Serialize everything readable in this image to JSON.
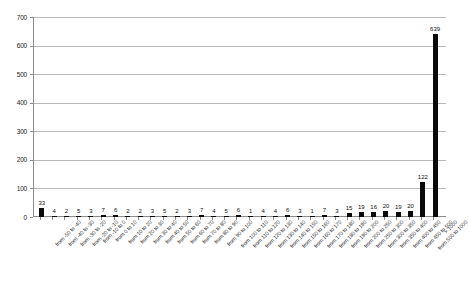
{
  "chart_data": {
    "type": "bar",
    "title": "",
    "subtitle": "",
    "xlabel": "",
    "ylabel": "",
    "ylim": [
      0,
      700
    ],
    "ytick_step": 100,
    "yticks": [
      0,
      100,
      200,
      300,
      400,
      500,
      600,
      700
    ],
    "ytick_labels": [
      "0",
      "100",
      "200",
      "300",
      "400",
      "500",
      "600",
      "700"
    ],
    "grid": true,
    "grid_axis": "y",
    "legend": false,
    "legend_position": "none",
    "bar_color": "#0a0a0a",
    "show_value_labels": true,
    "categories": [
      "from -50 to -40",
      "from -40 to -30",
      "from -30 to -20",
      "from -20 to -10",
      "from -10 to 0",
      "from 0 to 10",
      "from 10 to 20",
      "from 20 to 30",
      "from 30 to 40",
      "from 40 to 50",
      "from 50 to 60",
      "from 60 to 70",
      "from 70 to 80",
      "from 80 to 90",
      "from 90 to 100",
      "from 100 to 110",
      "from 110 to 120",
      "from 120 to 130",
      "from 130 to 140",
      "from 140 to 150",
      "from 150 to 160",
      "from 160 to 170",
      "from 170 to 180",
      "from 180 to 190",
      "from 190 to 200",
      "from 200 to 250",
      "from 250 to 300",
      "from 300 to 350",
      "from 350 to 400",
      "from 400 to 450",
      "from 450 to 500",
      "from 500 to 1000",
      "> 1000"
    ],
    "values": [
      33,
      4,
      2,
      5,
      3,
      7,
      6,
      2,
      2,
      3,
      5,
      2,
      3,
      7,
      4,
      5,
      6,
      1,
      4,
      4,
      6,
      3,
      1,
      7,
      3,
      15,
      19,
      16,
      20,
      19,
      20,
      122,
      639
    ],
    "value_labels": [
      "33",
      "4",
      "2",
      "5",
      "3",
      "7",
      "6",
      "2",
      "2",
      "3",
      "5",
      "2",
      "3",
      "7",
      "4",
      "5",
      "6",
      "1",
      "4",
      "4",
      "6",
      "3",
      "1",
      "7",
      "3",
      "15",
      "19",
      "16",
      "20",
      "19",
      "20",
      "122",
      "639"
    ]
  }
}
